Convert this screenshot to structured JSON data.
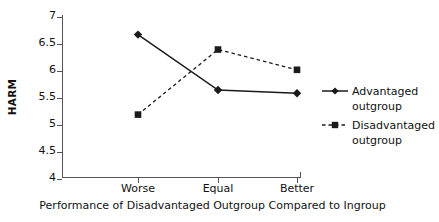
{
  "chart_data": {
    "type": "line",
    "title": "",
    "xlabel": "Performance of Disadvantaged Outgroup Compared to Ingroup",
    "ylabel": "HARM",
    "categories": [
      "Worse",
      "Equal",
      "Better"
    ],
    "xticklabels": [
      "Worse",
      "Equal",
      "Better"
    ],
    "yticklabels": [
      "4",
      "4.5",
      "5",
      "5.5",
      "6",
      "6.5",
      "7"
    ],
    "ylim": [
      4,
      7
    ],
    "ytick_values": [
      4,
      4.5,
      5,
      5.5,
      6,
      6.5,
      7
    ],
    "grid": false,
    "legend_position": "right",
    "series": [
      {
        "name": "Advantaged outgroup",
        "label_line1": "Advantaged",
        "label_line2": "outgroup",
        "linestyle": "solid",
        "marker": "diamond",
        "color": "#1a1a1a",
        "values": [
          6.67,
          5.63,
          5.57
        ]
      },
      {
        "name": "Disadvantaged outgroup",
        "label_line1": "Disadvantaged",
        "label_line2": "outgroup",
        "linestyle": "dashed",
        "marker": "square",
        "color": "#1a1a1a",
        "values": [
          5.17,
          6.39,
          6.01
        ]
      }
    ]
  },
  "axis": {
    "ylabel": "HARM",
    "xlabel": "Performance of Disadvantaged Outgroup Compared to Ingroup",
    "yticks": [
      {
        "label": "7"
      },
      {
        "label": "6.5"
      },
      {
        "label": "6"
      },
      {
        "label": "5.5"
      },
      {
        "label": "5"
      },
      {
        "label": "4.5"
      },
      {
        "label": "4"
      }
    ],
    "xticks": [
      {
        "label": "Worse"
      },
      {
        "label": "Equal"
      },
      {
        "label": "Better"
      }
    ]
  },
  "legend": {
    "items": [
      {
        "line1": "Advantaged",
        "line2": "outgroup"
      },
      {
        "line1": "Disadvantaged",
        "line2": "outgroup"
      }
    ]
  }
}
